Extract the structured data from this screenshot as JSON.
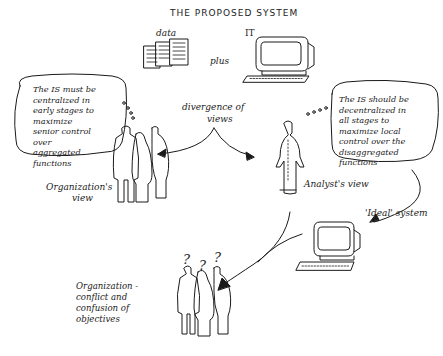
{
  "title": "THE PROPOSED SYSTEM",
  "inputs": {
    "data_label": "data",
    "plus_label": "plus",
    "it_label": "IT"
  },
  "divergence": {
    "line1": "divergence of",
    "line2": "views"
  },
  "organization_view": {
    "bubble_lines": [
      "The IS must be",
      "centralized in",
      "early stages to",
      "maximize",
      "senior control",
      "over",
      "aggregated",
      "functions"
    ],
    "label_line1": "Organization's",
    "label_line2": "view"
  },
  "analyst_view": {
    "bubble_lines": [
      "The IS should be",
      "decentralized in",
      "all stages to",
      "maximize local",
      "control over the",
      "disaggregated",
      "functions"
    ],
    "label": "Analyst's view"
  },
  "ideal_system": {
    "label": "'Ideal' system"
  },
  "outcome": {
    "question_marks": [
      "?",
      "?",
      "?"
    ],
    "label_lines": [
      "Organization -",
      "conflict and",
      "confusion of",
      "objectives"
    ]
  },
  "colors": {
    "ink": "#1a1a1a",
    "background": "#ffffff"
  }
}
